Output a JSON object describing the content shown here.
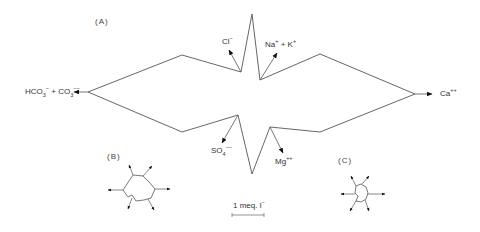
{
  "figure": {
    "panels": {
      "a": "(A)",
      "b": "(B)",
      "c": "(C)"
    },
    "ions": {
      "cl": {
        "base": "Cl",
        "charge": "−"
      },
      "na_k": {
        "base1": "Na",
        "charge1": "+",
        "joiner": " + K",
        "charge2": "+"
      },
      "hco3_co3": {
        "base1": "HCO",
        "sub1": "3",
        "charge1": "−",
        "joiner": " + CO",
        "sub2": "3",
        "charge2": "−−"
      },
      "ca": {
        "base": "Ca",
        "charge": "++"
      },
      "so4": {
        "base": "SO",
        "sub": "4",
        "charge": "−−"
      },
      "mg": {
        "base": "Mg",
        "charge": "++"
      }
    },
    "scale": {
      "label": "1 meq. l",
      "sup": "−"
    },
    "colors": {
      "line": "#555555",
      "arrow": "#111111",
      "background": "#ffffff"
    }
  }
}
